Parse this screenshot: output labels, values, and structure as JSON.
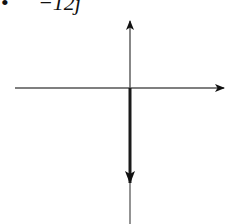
{
  "header": {
    "bullet": "•",
    "expression": "−12j"
  },
  "diagram": {
    "type": "vector_on_axes",
    "origin": {
      "x": 130,
      "y": 88
    },
    "axes": {
      "horizontal": {
        "x1": 15,
        "x2": 225,
        "y": 88,
        "arrow": "right"
      },
      "vertical": {
        "x": 130,
        "y1": 20,
        "y2": 224,
        "arrow": "up"
      }
    },
    "vector": {
      "label": "−12j",
      "direction": "down",
      "x": 130,
      "y_start": 88,
      "y_tip": 183
    },
    "colors": {
      "axis": "#555555",
      "vector": "#1a1a1a",
      "background": "#ffffff"
    }
  }
}
